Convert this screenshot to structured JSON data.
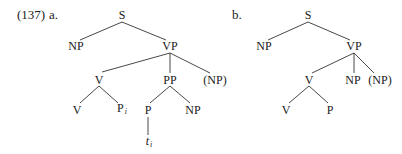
{
  "example": {
    "number": "(137)",
    "a_label": "a.",
    "b_label": "b."
  },
  "tree_a": {
    "S": "S",
    "NP_subj": "NP",
    "VP": "VP",
    "V_complex": "V",
    "PP": "PP",
    "NP_opt": "(NP)",
    "V_head": "V",
    "P_i": "P",
    "P_i_index": "i",
    "P": "P",
    "NP_obj": "NP",
    "trace": "t",
    "trace_index": "i"
  },
  "tree_b": {
    "S": "S",
    "NP_subj": "NP",
    "VP": "VP",
    "V_complex": "V",
    "NP_obj": "NP",
    "NP_opt": "(NP)",
    "V_head": "V",
    "P": "P"
  }
}
